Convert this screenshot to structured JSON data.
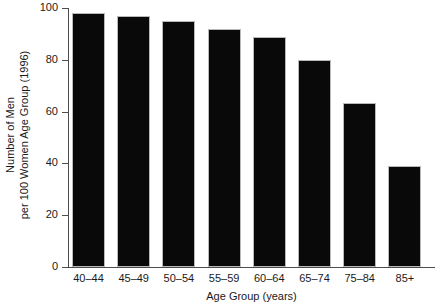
{
  "chart_data": {
    "type": "bar",
    "title": "",
    "xlabel": "Age Group (years)",
    "ylabel_line1": "Number of Men",
    "ylabel_line2": "per 100 Women Age Group (1996)",
    "categories": [
      "40–44",
      "45–49",
      "50–54",
      "55–59",
      "60–64",
      "65–74",
      "75–84",
      "85+"
    ],
    "values": [
      98,
      97,
      95,
      92,
      89,
      80,
      63.5,
      39
    ],
    "ylim": [
      0,
      100
    ],
    "yticks": [
      0,
      20,
      40,
      60,
      80,
      100
    ],
    "ytick_labels": [
      "0",
      "20",
      "40",
      "60",
      "80",
      "100"
    ],
    "grid": false,
    "legend": "none",
    "bar_color": "#090909",
    "bar_edge_color": "#b9b9b9",
    "axis_color": "#4d4d4d",
    "background_color": "#ffffff"
  }
}
